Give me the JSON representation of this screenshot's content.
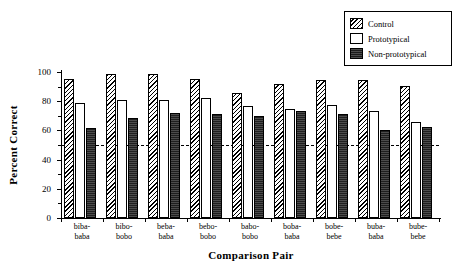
{
  "chart_data": {
    "type": "bar",
    "title": "",
    "xlabel": "Comparison Pair",
    "ylabel": "Percent Correct",
    "ylim": [
      0,
      100
    ],
    "yticks": [
      0,
      20,
      40,
      60,
      80,
      100
    ],
    "grid": false,
    "legend_position": "top-right",
    "categories": [
      "biba-\nbaba",
      "bibo-\nbobo",
      "beba-\nbaba",
      "bebo-\nbobo",
      "babo-\nbobo",
      "boba-\nbaba",
      "bobe-\nbebe",
      "buba-\nbaba",
      "bube-\nbebe"
    ],
    "categories_flat": [
      "biba-baba",
      "bibo-bobo",
      "beba-baba",
      "bebo-bobo",
      "babo-bobo",
      "boba-baba",
      "bobe-bebe",
      "buba-baba",
      "bube-bebe"
    ],
    "series": [
      {
        "name": "Control",
        "fill": "diagonal-hatch",
        "values": [
          95,
          98.5,
          98.5,
          95,
          85.5,
          92,
          94.5,
          94.5,
          90.5
        ]
      },
      {
        "name": "Prototypical",
        "fill": "white",
        "values": [
          78.5,
          80.5,
          80.5,
          82.5,
          76.5,
          75,
          77.5,
          73.5,
          66
        ]
      },
      {
        "name": "Non-prototypical",
        "fill": "solid-dark",
        "values": [
          61.5,
          68.5,
          72,
          71.5,
          70,
          73.5,
          71.5,
          60.5,
          62.5
        ]
      }
    ],
    "reference_line": {
      "value": 50,
      "style": "dashed",
      "label": ""
    }
  },
  "legend": {
    "items": [
      {
        "label": "Control"
      },
      {
        "label": "Prototypical"
      },
      {
        "label": "Non-prototypical"
      }
    ]
  },
  "axes": {
    "y_title": "Percent Correct",
    "x_title": "Comparison Pair",
    "y_tick_labels": [
      "0",
      "20",
      "40",
      "60",
      "80",
      "100"
    ]
  }
}
